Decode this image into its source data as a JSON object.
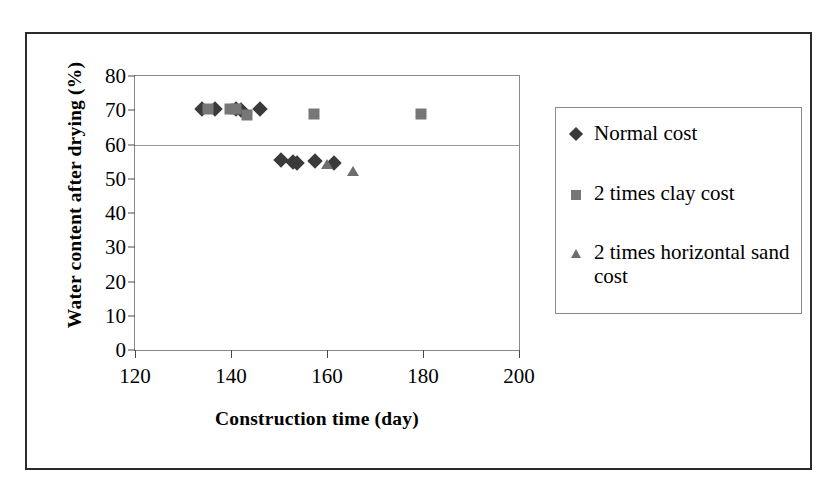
{
  "chart_data": {
    "type": "scatter",
    "title": "",
    "xlabel": "Construction time  (day)",
    "ylabel": "Water content after drying (%)",
    "xlim": [
      120,
      200
    ],
    "ylim": [
      0,
      80
    ],
    "xticks": [
      120,
      140,
      160,
      180,
      200
    ],
    "yticks": [
      0,
      10,
      20,
      30,
      40,
      50,
      60,
      70,
      80
    ],
    "grid": "horizontal-gridline-at-60",
    "legend_position": "right",
    "series": [
      {
        "name": "Normal cost",
        "marker": "diamond",
        "color": "#3a3a3a",
        "points": [
          {
            "x": 134.0,
            "y": 70.3
          },
          {
            "x": 136.7,
            "y": 70.3
          },
          {
            "x": 141.0,
            "y": 70.3
          },
          {
            "x": 142.0,
            "y": 70.0
          },
          {
            "x": 146.0,
            "y": 70.3
          },
          {
            "x": 150.5,
            "y": 55.4
          },
          {
            "x": 153.0,
            "y": 54.9
          },
          {
            "x": 153.8,
            "y": 54.5
          },
          {
            "x": 157.5,
            "y": 55.3
          },
          {
            "x": 161.5,
            "y": 54.6
          }
        ]
      },
      {
        "name": "2 times clay cost",
        "marker": "square",
        "color": "#777777",
        "points": [
          {
            "x": 135.3,
            "y": 70.3
          },
          {
            "x": 139.8,
            "y": 70.3
          },
          {
            "x": 141.0,
            "y": 70.3
          },
          {
            "x": 143.3,
            "y": 68.7
          },
          {
            "x": 157.2,
            "y": 68.8
          },
          {
            "x": 179.5,
            "y": 68.8
          }
        ]
      },
      {
        "name": "2 times horizontal sand cost",
        "marker": "triangle",
        "color": "#6e6e6e",
        "points": [
          {
            "x": 160.0,
            "y": 54.4
          },
          {
            "x": 165.5,
            "y": 52.4
          }
        ]
      }
    ]
  },
  "axes": {
    "y_title": "Water content after drying (%)",
    "x_title": "Construction time  (day)",
    "y_tick_labels": [
      "80",
      "70",
      "60",
      "50",
      "40",
      "30",
      "20",
      "10",
      "0"
    ],
    "x_tick_labels": [
      "120",
      "140",
      "160",
      "180",
      "200"
    ]
  },
  "legend": {
    "items": [
      {
        "label": "Normal cost",
        "marker": "diamond"
      },
      {
        "label": "2 times clay cost",
        "marker": "square"
      },
      {
        "label": "2 times horizontal sand cost",
        "marker": "triangle"
      }
    ]
  },
  "colors": {
    "normal_cost": "#3a3a3a",
    "clay_cost": "#777777",
    "sand_cost": "#6e6e6e",
    "frame": "#2b2b2b",
    "axis": "#8a8a8a",
    "background": "#ffffff"
  }
}
